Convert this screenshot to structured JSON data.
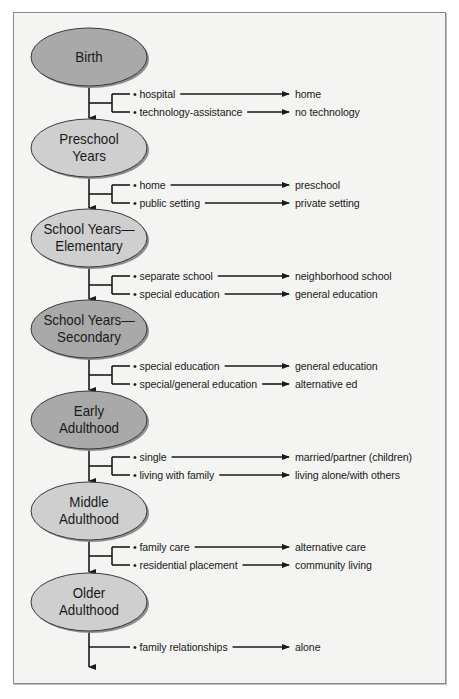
{
  "diagram": {
    "colors": {
      "frame_bg": "#f4f4f2",
      "frame_border": "#8a8a8a",
      "ellipse_dark": "#a9a9a9",
      "ellipse_light": "#cfcfcf",
      "line": "#1a1a1a"
    },
    "stages": [
      {
        "label_lines": [
          "Birth"
        ],
        "tone": "dark"
      },
      {
        "label_lines": [
          "Preschool",
          "Years"
        ],
        "tone": "light"
      },
      {
        "label_lines": [
          "School Years—",
          "Elementary"
        ],
        "tone": "light"
      },
      {
        "label_lines": [
          "School Years—",
          "Secondary"
        ],
        "tone": "dark"
      },
      {
        "label_lines": [
          "Early",
          "Adulthood"
        ],
        "tone": "dark"
      },
      {
        "label_lines": [
          "Middle",
          "Adulthood"
        ],
        "tone": "light"
      },
      {
        "label_lines": [
          "Older",
          "Adulthood"
        ],
        "tone": "light"
      }
    ],
    "transitions": [
      [
        {
          "from": "• hospital",
          "to": "home"
        },
        {
          "from": "• technology-assistance",
          "to": "no technology"
        }
      ],
      [
        {
          "from": "• home",
          "to": "preschool"
        },
        {
          "from": "• public setting",
          "to": "private setting"
        }
      ],
      [
        {
          "from": "• separate school",
          "to": "neighborhood school"
        },
        {
          "from": "• special education",
          "to": "general education"
        }
      ],
      [
        {
          "from": "• special education",
          "to": "general education"
        },
        {
          "from": "• special/general education",
          "to": "alternative ed"
        }
      ],
      [
        {
          "from": "• single",
          "to": "married/partner (children)"
        },
        {
          "from": "• living with family",
          "to": "living alone/with others"
        }
      ],
      [
        {
          "from": "• family care",
          "to": "alternative care"
        },
        {
          "from": "• residential placement",
          "to": "community living"
        }
      ],
      [
        {
          "from": "• family relationships",
          "to": "alone"
        }
      ]
    ]
  }
}
